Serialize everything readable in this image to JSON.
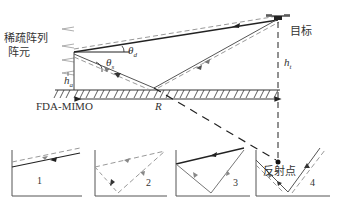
{
  "diagram": {
    "labels": {
      "sparse_array": "稀疏阵列",
      "array_element": "阵元",
      "target": "目标",
      "reflection_point": "反射点",
      "radar": "FDA-MIMO",
      "range": "R",
      "radar_height": "h",
      "radar_height_sub": "a",
      "target_height": "h",
      "target_height_sub": "t",
      "theta_direct": "θ",
      "theta_direct_sub": "d",
      "theta_reflect": "θ",
      "theta_reflect_sub": "s"
    },
    "paths": [
      {
        "id": 1,
        "label": "1",
        "description": "direct transmit, direct receive"
      },
      {
        "id": 2,
        "label": "2",
        "description": "direct transmit, reflected receive"
      },
      {
        "id": 3,
        "label": "3",
        "description": "reflected transmit, direct receive"
      },
      {
        "id": 4,
        "label": "4",
        "description": "reflected transmit, reflected receive"
      }
    ],
    "colors": {
      "solid_line": "#222222",
      "dashed_line": "#999999",
      "ground_hatch": "#333333"
    }
  }
}
